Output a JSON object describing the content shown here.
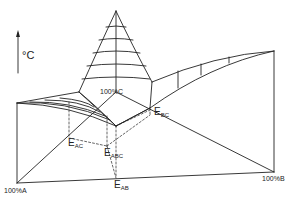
{
  "diagram": {
    "type": "ternary eutectic phase diagram (3D temperature-composition)",
    "axis": {
      "label": "°C",
      "direction": "up"
    },
    "corners": {
      "a": "100%A",
      "b": "100%B",
      "c": "100%C"
    },
    "eutectics": {
      "ac": {
        "main": "E",
        "sub": "AC"
      },
      "abc": {
        "main": "E",
        "sub": "ABC"
      },
      "ab": {
        "main": "E",
        "sub": "AB"
      },
      "bc": {
        "main": "E",
        "sub": "BC"
      }
    },
    "colors": {
      "line": "#222222",
      "background": "#ffffff"
    }
  }
}
